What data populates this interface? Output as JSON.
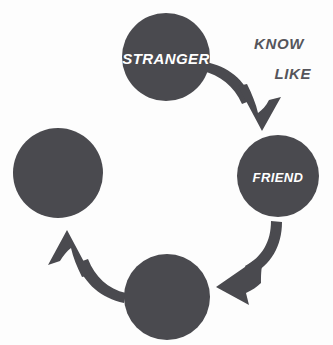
{
  "diagram": {
    "type": "cycle",
    "background_color": "#fdfdfd",
    "node_color": "#4a4a4f",
    "arrow_color": "#4a4a4f",
    "node_text_color": "#ffffff",
    "stage_text_color": "#55555b",
    "nodes": [
      {
        "id": "stranger",
        "label": "STRANGER",
        "has_label": true,
        "cx": 166,
        "cy": 57,
        "r": 44,
        "font_size": 15
      },
      {
        "id": "friend",
        "label": "FRIEND",
        "has_label": true,
        "cx": 278,
        "cy": 176,
        "r": 41,
        "font_size": 13
      },
      {
        "id": "node-bottom",
        "label": "",
        "has_label": false,
        "cx": 167,
        "cy": 297,
        "r": 43,
        "font_size": 13
      },
      {
        "id": "node-left",
        "label": "",
        "has_label": false,
        "cx": 58,
        "cy": 173,
        "r": 45,
        "font_size": 13
      }
    ],
    "arrows": [
      {
        "id": "arrow-stranger-to-friend",
        "from": "stranger",
        "to": "friend"
      },
      {
        "id": "arrow-friend-to-bottom",
        "from": "friend",
        "to": "node-bottom"
      },
      {
        "id": "arrow-bottom-to-left",
        "from": "node-bottom",
        "to": "node-left"
      }
    ],
    "stage_labels": [
      {
        "id": "know",
        "text": "KNOW",
        "x": 304,
        "y": 43,
        "font_size": 15
      },
      {
        "id": "like",
        "text": "LIKE",
        "x": 311,
        "y": 73,
        "font_size": 15
      }
    ]
  }
}
